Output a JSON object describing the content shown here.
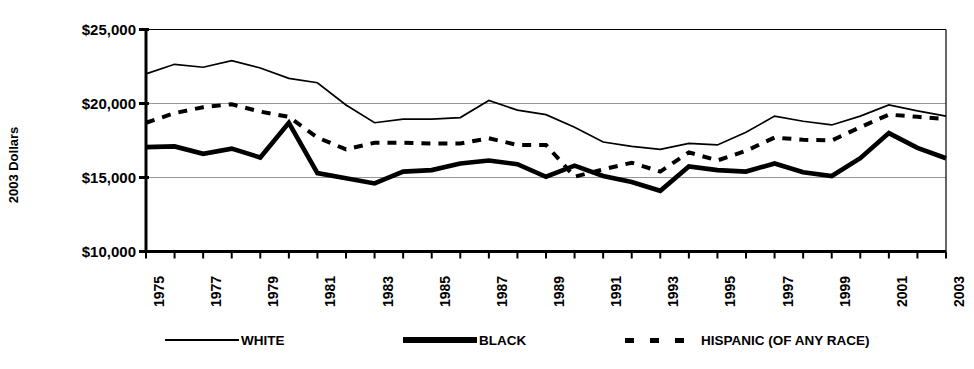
{
  "chart_data": {
    "type": "line",
    "title": "",
    "xlabel": "",
    "ylabel": "2003 Dollars",
    "ylim": [
      10000,
      25000
    ],
    "yticks": [
      10000,
      15000,
      20000,
      25000
    ],
    "ytick_labels": [
      "$10,000",
      "$15,000",
      "$20,000",
      "$25,000"
    ],
    "grid": true,
    "legend_position": "bottom",
    "x": [
      1975,
      1976,
      1977,
      1978,
      1979,
      1980,
      1981,
      1982,
      1983,
      1984,
      1985,
      1986,
      1987,
      1988,
      1989,
      1990,
      1991,
      1992,
      1993,
      1994,
      1995,
      1996,
      1997,
      1998,
      1999,
      2000,
      2001,
      2002,
      2003
    ],
    "xtick_labels": [
      "1975",
      "1977",
      "1979",
      "1981",
      "1983",
      "1985",
      "1987",
      "1989",
      "1991",
      "1993",
      "1995",
      "1997",
      "1999",
      "2001",
      "2003"
    ],
    "xtick_years": [
      1975,
      1977,
      1979,
      1981,
      1983,
      1985,
      1987,
      1989,
      1991,
      1993,
      1995,
      1997,
      1999,
      2001,
      2003
    ],
    "series": [
      {
        "name": "WHITE",
        "style": "solid-thin",
        "values": [
          22000,
          22650,
          22450,
          22900,
          22400,
          21700,
          21400,
          19900,
          18700,
          18950,
          18950,
          19050,
          20200,
          19550,
          19250,
          18400,
          17400,
          17100,
          16900,
          17300,
          17200,
          18050,
          19150,
          18800,
          18550,
          19150,
          19900,
          19500,
          19150
        ]
      },
      {
        "name": "BLACK",
        "style": "solid-thick",
        "values": [
          17050,
          17100,
          16600,
          16950,
          16350,
          18700,
          15300,
          14950,
          14600,
          15400,
          15500,
          15950,
          16150,
          15900,
          15050,
          15800,
          15100,
          14700,
          14100,
          15750,
          15500,
          15400,
          15950,
          15350,
          15100,
          16300,
          18000,
          17000,
          16300
        ]
      },
      {
        "name": "HISPANIC (OF ANY RACE)",
        "style": "dashed",
        "values": [
          18700,
          19350,
          19750,
          19950,
          19450,
          19100,
          17700,
          16900,
          17350,
          17350,
          17300,
          17300,
          17650,
          17200,
          17200,
          15050,
          15550,
          16000,
          15400,
          16700,
          16150,
          16800,
          17700,
          17550,
          17500,
          18400,
          19250,
          19100,
          18950
        ]
      }
    ]
  },
  "legend": {
    "items": [
      {
        "label": "WHITE",
        "style": "solid-thin"
      },
      {
        "label": "BLACK",
        "style": "solid-thick"
      },
      {
        "label": "HISPANIC (OF ANY RACE)",
        "style": "dashed"
      }
    ]
  },
  "axis": {
    "y_title": "2003 Dollars"
  }
}
